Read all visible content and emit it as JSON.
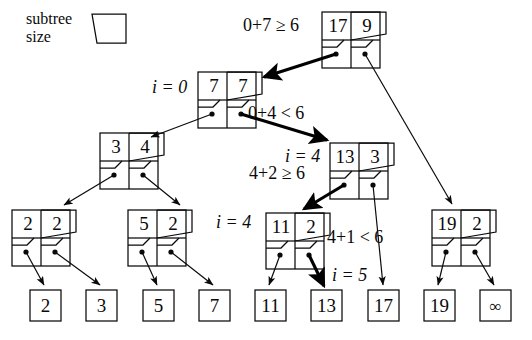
{
  "figure": {
    "type": "binary-search-tree-diagram",
    "legend": {
      "line1": "subtree",
      "line2": "size",
      "shape": "trapezoid-cell"
    },
    "colors": {
      "stroke": "#0a0a0a",
      "background": "#ffffff",
      "highlight_stroke": "#000000"
    }
  },
  "nodes": [
    {
      "id": "root",
      "key": "17",
      "size": "9",
      "label": ""
    },
    {
      "id": "n77",
      "key": "7",
      "size": "7",
      "label": "i = 0"
    },
    {
      "id": "n34",
      "key": "3",
      "size": "4",
      "label": ""
    },
    {
      "id": "n22",
      "key": "2",
      "size": "2",
      "label": ""
    },
    {
      "id": "n52",
      "key": "5",
      "size": "2",
      "label": ""
    },
    {
      "id": "n133",
      "key": "13",
      "size": "3",
      "label": "i = 4"
    },
    {
      "id": "n112",
      "key": "11",
      "size": "2",
      "label": "i = 4"
    },
    {
      "id": "n192",
      "key": "19",
      "size": "2",
      "label": ""
    }
  ],
  "leaves": [
    {
      "id": "l2",
      "value": "2"
    },
    {
      "id": "l3",
      "value": "3"
    },
    {
      "id": "l5",
      "value": "5"
    },
    {
      "id": "l7",
      "value": "7"
    },
    {
      "id": "l11",
      "value": "11"
    },
    {
      "id": "l13",
      "value": "13"
    },
    {
      "id": "l17",
      "value": "17"
    },
    {
      "id": "l19",
      "value": "19"
    },
    {
      "id": "linf",
      "value": "∞"
    }
  ],
  "annotations": [
    {
      "id": "a1",
      "text": "0+7 ≥ 6"
    },
    {
      "id": "a2",
      "text": "0+4 < 6"
    },
    {
      "id": "a3",
      "text": "4+2 ≥ 6"
    },
    {
      "id": "a4",
      "text": "4+1 < 6"
    },
    {
      "id": "a5",
      "text": "i = 0"
    },
    {
      "id": "a6",
      "text": "i = 4"
    },
    {
      "id": "a7",
      "text": "i = 4"
    },
    {
      "id": "a8",
      "text": "i = 5"
    }
  ],
  "labels": {
    "i0": "i = 0",
    "i4_right": "i = 4",
    "i4_left": "i = 4",
    "i5": "i = 5",
    "cmp_root": "0+7 ≥ 6",
    "cmp_left": "0+4 < 6",
    "cmp_mid": "4+2 ≥ 6",
    "cmp_low": "4+1 < 6"
  }
}
